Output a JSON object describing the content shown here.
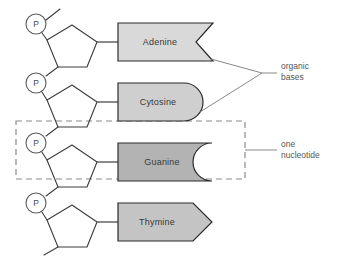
{
  "diagram": {
    "phosphate_symbol": "P",
    "nucleotides": [
      {
        "base": "Adenine",
        "shape": "notched-tail",
        "fill": "#d9d9d9"
      },
      {
        "base": "Cytosine",
        "shape": "round-end",
        "fill": "#cfcfcf"
      },
      {
        "base": "Guanine",
        "shape": "concave-end",
        "fill": "#b3b3b3"
      },
      {
        "base": "Thymine",
        "shape": "arrow-point",
        "fill": "#c4c4c4"
      }
    ],
    "annotations": [
      {
        "id": "organic-bases",
        "line1": "organic",
        "line2": "bases"
      },
      {
        "id": "one-nucleotide",
        "line1": "one",
        "line2": "nucleotide"
      }
    ],
    "colors": {
      "stroke": "#2b2b2b",
      "backbone": "#3c3c3c",
      "annotation_text": "#555555",
      "dash": "#8a8a8a",
      "background": "#ffffff"
    }
  }
}
